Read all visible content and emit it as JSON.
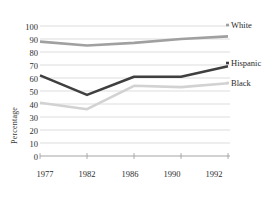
{
  "chart_data": {
    "type": "line",
    "title": "",
    "xlabel": "",
    "ylabel": "Percentage",
    "categories": [
      "1977",
      "1982",
      "1986",
      "1990",
      "1992"
    ],
    "ylim": [
      0,
      100
    ],
    "ytick_step": 10,
    "yticks": [
      "0",
      "10",
      "20",
      "30",
      "40",
      "50",
      "60",
      "70",
      "80",
      "90",
      "100"
    ],
    "grid": true,
    "grid_axis": "y",
    "legend_position": "right-inline",
    "series": [
      {
        "name": "White",
        "color": "#a0a0a0",
        "values": [
          88,
          85,
          87,
          90,
          92
        ]
      },
      {
        "name": "Hispanic",
        "color": "#3f3f3f",
        "values": [
          62,
          47,
          61,
          61,
          69
        ]
      },
      {
        "name": "Black",
        "color": "#d2d2d2",
        "values": [
          41,
          36,
          54,
          53,
          56
        ]
      }
    ]
  },
  "labels": {
    "white": "White",
    "hispanic": "Hispanic",
    "black": "Black",
    "y_axis_title": "Percentage"
  },
  "ticks": {
    "y": [
      "100",
      "90",
      "80",
      "70",
      "60",
      "50",
      "40",
      "30",
      "20",
      "10",
      "0"
    ],
    "x": [
      "1977",
      "1982",
      "1986",
      "1990",
      "1992"
    ]
  },
  "colors": {
    "white_line": "#a0a0a0",
    "hispanic_line": "#3f3f3f",
    "black_line": "#d2d2d2",
    "grid": "#cfcfcf",
    "axis": "#9a9a9a",
    "text": "#2e2e2e"
  }
}
